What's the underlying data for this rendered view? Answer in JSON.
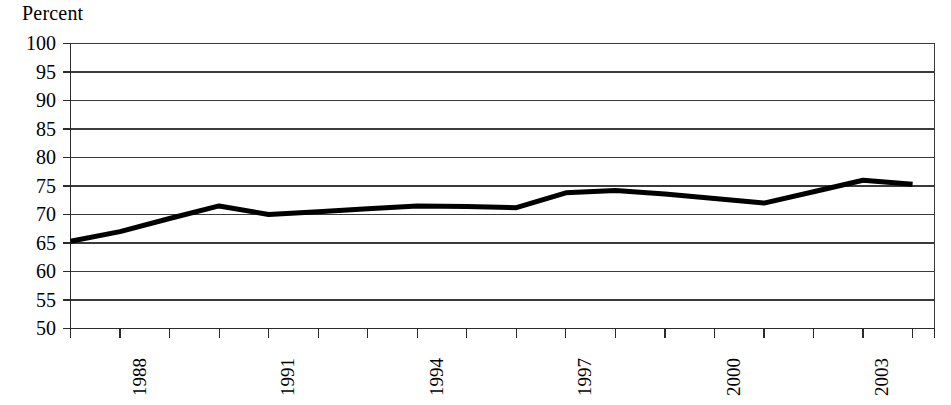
{
  "chart_data": {
    "type": "line",
    "title": "",
    "xlabel": "",
    "ylabel": "Percent",
    "ylim": [
      50,
      100
    ],
    "ytick_step": 5,
    "yticks": [
      100,
      95,
      90,
      85,
      80,
      75,
      70,
      65,
      60,
      55,
      50
    ],
    "xlim": [
      1987,
      2004
    ],
    "xticks_labeled": [
      "1988",
      "1991",
      "1994",
      "1997",
      "2000",
      "2003"
    ],
    "grid": "horizontal",
    "legend": "none",
    "line_color": "#000000",
    "line_width_px": 5,
    "x": [
      1987,
      1988,
      1989,
      1990,
      1991,
      1992,
      1993,
      1994,
      1995,
      1996,
      1997,
      1998,
      1999,
      2000,
      2001,
      2002,
      2003,
      2004
    ],
    "values": [
      65.3,
      67.0,
      69.3,
      71.5,
      70.0,
      70.5,
      71.0,
      71.5,
      71.4,
      71.2,
      73.8,
      74.2,
      73.6,
      72.8,
      72.0,
      74.0,
      76.0,
      75.3
    ],
    "series": [
      {
        "name": "Percent",
        "values": [
          65.3,
          67.0,
          69.3,
          71.5,
          70.0,
          70.5,
          71.0,
          71.5,
          71.4,
          71.2,
          73.8,
          74.2,
          73.6,
          72.8,
          72.0,
          74.0,
          76.0,
          75.3
        ]
      }
    ]
  },
  "axis": {
    "unit_label": "Percent",
    "y_labels": [
      "100",
      "95",
      "90",
      "85",
      "80",
      "75",
      "70",
      "65",
      "60",
      "55",
      "50"
    ],
    "x_labels": [
      "1988",
      "1991",
      "1994",
      "1997",
      "2000",
      "2003"
    ]
  },
  "header": {
    "cut_off_title": ""
  }
}
